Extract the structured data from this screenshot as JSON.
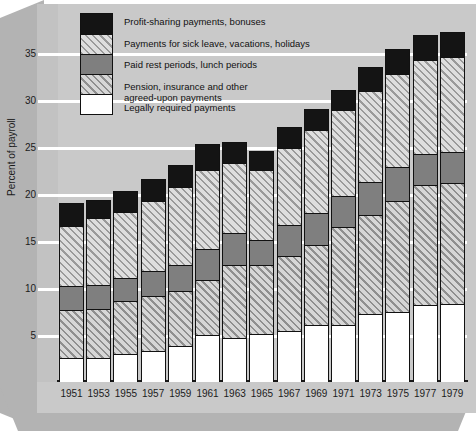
{
  "chart_data": {
    "type": "bar",
    "subtype": "stacked-bar",
    "title": "",
    "xlabel": "",
    "ylabel": "Percent of payroll",
    "ylim": [
      0,
      38
    ],
    "yticks": [
      5,
      10,
      15,
      20,
      25,
      30,
      35
    ],
    "grid": true,
    "legend_position": "top-left",
    "categories": [
      "1951",
      "1953",
      "1955",
      "1957",
      "1959",
      "1961",
      "1963",
      "1965",
      "1967",
      "1969",
      "1971",
      "1973",
      "1975",
      "1977",
      "1979"
    ],
    "series": [
      {
        "name": "Legally required payments",
        "key": "legally_required",
        "swatch": "white",
        "values": [
          2.6,
          2.6,
          3.0,
          3.3,
          3.8,
          5.0,
          4.7,
          5.1,
          5.4,
          6.1,
          6.1,
          7.2,
          7.5,
          8.2,
          8.3
        ]
      },
      {
        "name": "Pension, insurance and other agreed-upon payments",
        "key": "pension_insurance",
        "swatch": "hatch-dark",
        "values": [
          5.1,
          5.2,
          5.6,
          5.9,
          5.9,
          5.9,
          7.7,
          7.3,
          8.0,
          8.5,
          10.4,
          10.6,
          11.8,
          12.8,
          12.9
        ]
      },
      {
        "name": "Paid rest periods, lunch periods",
        "key": "paid_rest",
        "swatch": "gray",
        "values": [
          2.5,
          2.5,
          2.5,
          2.6,
          2.8,
          3.3,
          3.5,
          2.7,
          3.3,
          3.4,
          3.3,
          3.5,
          3.6,
          3.3,
          3.3
        ]
      },
      {
        "name": "Payments for sick leave, vacations, holidays",
        "key": "sick_leave_vacations",
        "swatch": "hatch-light",
        "values": [
          6.4,
          7.1,
          7.0,
          7.5,
          8.2,
          8.4,
          7.4,
          7.5,
          8.2,
          8.8,
          9.1,
          9.7,
          9.9,
          10.0,
          10.1
        ]
      },
      {
        "name": "Profit-sharing payments, bonuses",
        "key": "profit_sharing",
        "swatch": "black",
        "values": [
          2.4,
          2.0,
          2.2,
          2.3,
          2.4,
          2.7,
          2.2,
          2.0,
          2.2,
          2.3,
          2.2,
          2.5,
          2.6,
          2.6,
          2.6
        ]
      }
    ],
    "totals": [
      19.0,
      19.4,
      20.3,
      21.6,
      23.1,
      25.3,
      25.5,
      24.6,
      27.1,
      29.1,
      31.1,
      33.5,
      35.4,
      36.9,
      37.2
    ]
  },
  "legend": {
    "items": [
      {
        "label": "Profit-sharing payments, bonuses",
        "swatch": "black"
      },
      {
        "label": "Payments for sick leave, vacations, holidays",
        "swatch": "hatch-light"
      },
      {
        "label": "Paid rest periods, lunch periods",
        "swatch": "gray"
      },
      {
        "label": "Pension, insurance and other\nagreed-upon payments",
        "swatch": "hatch-dark"
      },
      {
        "label": "Legally required payments",
        "swatch": "white"
      }
    ]
  },
  "axes": {
    "y_label": "Percent of payroll",
    "y_ticks": [
      "35",
      "30",
      "25",
      "20",
      "15",
      "10",
      "5"
    ],
    "x_ticks": [
      "1951",
      "1953",
      "1955",
      "1957",
      "1959",
      "1961",
      "1963",
      "1965",
      "1967",
      "1969",
      "1971",
      "1973",
      "1975",
      "1977",
      "1979"
    ]
  },
  "colors": {
    "background": "#c9c9c9",
    "frame": "#b3b3b3",
    "black_segment": "#141414",
    "gray_segment": "#7f7f7f",
    "white_segment": "#ffffff",
    "gridline": "#ffffff",
    "outline": "#111111"
  }
}
